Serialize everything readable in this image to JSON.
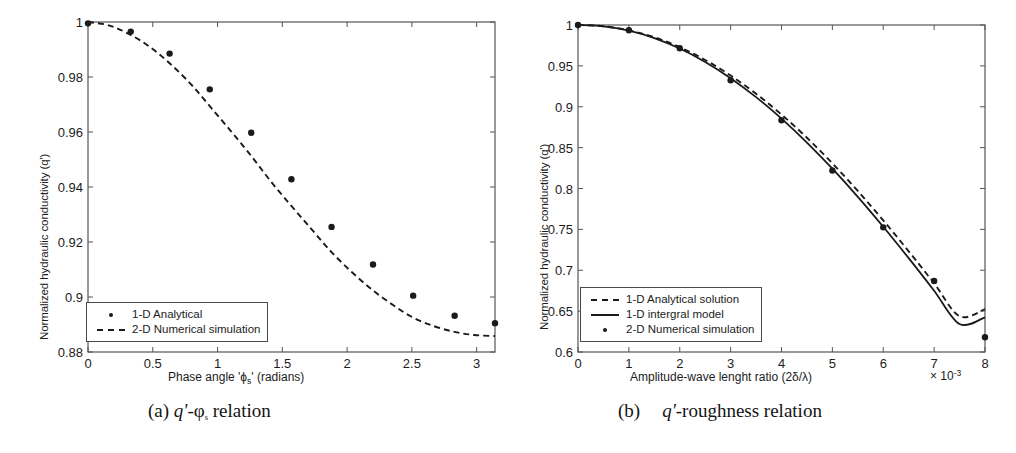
{
  "figure": {
    "background": "#ffffff",
    "ink_color": "#1a1a1a"
  },
  "panel_a": {
    "caption_prefix": "(a)",
    "caption_q": "q'",
    "caption_rest": "-φ",
    "caption_sub": "s",
    "caption_tail": " relation",
    "ylabel": "Normalized hydraulic conductivity (q')",
    "xlabel_pre": "Phase angle 'ϕ",
    "xlabel_sub": "s",
    "xlabel_post": "' (radians)",
    "legend": [
      {
        "key": "dot",
        "label": "1-D Analytical"
      },
      {
        "key": "dash",
        "label": "2-D Numerical simulation"
      }
    ]
  },
  "panel_b": {
    "caption_prefix": "(b)",
    "caption_q": "q'",
    "caption_tail": "-roughness relation",
    "ylabel": "Normalized hydraulic conductivity (q')",
    "xlabel": "Amplitude-wave lenght ratio (2δ/λ)",
    "exp_pre": "× 10",
    "exp_sup": "-3",
    "legend": [
      {
        "key": "dash",
        "label": "1-D Analytical solution"
      },
      {
        "key": "solid",
        "label": "1-D intergral model"
      },
      {
        "key": "dot",
        "label": "2-D Numerical simulation"
      }
    ]
  },
  "chart_data": [
    {
      "id": "panel-a",
      "type": "scatter",
      "title": "(a) q'-φs relation",
      "xlabel": "Phase angle 'ϕs' (radians)",
      "ylabel": "Normalized hydraulic conductivity (q')",
      "xlim": [
        0,
        3.1416
      ],
      "ylim": [
        0.88,
        1.0
      ],
      "xticks": [
        0,
        0.5,
        1,
        1.5,
        2,
        2.5,
        3
      ],
      "xticklabels": [
        "0",
        "0.5",
        "1",
        "1.5",
        "2",
        "2.5",
        "3"
      ],
      "yticks": [
        0.88,
        0.9,
        0.92,
        0.94,
        0.96,
        0.98,
        1.0
      ],
      "yticklabels": [
        "0.88",
        "0.9",
        "0.92",
        "0.94",
        "0.96",
        "0.98",
        "1"
      ],
      "grid": false,
      "legend_position": "lower-left",
      "series": [
        {
          "name": "1-D Analytical",
          "style": "markers",
          "marker": "circle",
          "x": [
            0.0,
            0.33,
            0.63,
            0.94,
            1.26,
            1.57,
            1.88,
            2.2,
            2.51,
            2.83,
            3.1416
          ],
          "y": [
            0.9995,
            0.9965,
            0.9885,
            0.9755,
            0.9597,
            0.9428,
            0.9255,
            0.9118,
            0.9005,
            0.8932,
            0.8905
          ]
        },
        {
          "name": "2-D Numerical simulation",
          "style": "dashed-line",
          "x": [
            0.0,
            0.16,
            0.31,
            0.47,
            0.63,
            0.79,
            0.94,
            1.1,
            1.26,
            1.41,
            1.57,
            1.73,
            1.88,
            2.04,
            2.2,
            2.36,
            2.51,
            2.67,
            2.83,
            2.98,
            3.1416
          ],
          "y": [
            1.0,
            0.9988,
            0.9958,
            0.9912,
            0.985,
            0.9776,
            0.9694,
            0.9605,
            0.9513,
            0.9421,
            0.9331,
            0.9244,
            0.9163,
            0.9089,
            0.9024,
            0.8969,
            0.8925,
            0.8894,
            0.8873,
            0.8862,
            0.8858
          ]
        }
      ]
    },
    {
      "id": "panel-b",
      "type": "scatter",
      "title": "(b) q'-roughness relation",
      "xlabel": "Amplitude-wave lenght ratio (2δ/λ)",
      "xlabel_multiplier": "× 10^-3",
      "ylabel": "Normalized hydraulic conductivity (q')",
      "xlim": [
        0,
        8
      ],
      "ylim": [
        0.6,
        1.0
      ],
      "xticks": [
        0,
        1,
        2,
        3,
        4,
        5,
        6,
        7,
        8
      ],
      "xticklabels": [
        "0",
        "1",
        "2",
        "3",
        "4",
        "5",
        "6",
        "7",
        "8"
      ],
      "yticks": [
        0.6,
        0.65,
        0.7,
        0.75,
        0.8,
        0.85,
        0.9,
        0.95,
        1.0
      ],
      "yticklabels": [
        "0.6",
        "0.65",
        "0.7",
        "0.75",
        "0.8",
        "0.85",
        "0.9",
        "0.95",
        "1"
      ],
      "grid": false,
      "legend_position": "lower-left",
      "series": [
        {
          "name": "1-D Analytical solution",
          "style": "dashed-line",
          "x": [
            0,
            0.5,
            1,
            1.5,
            2,
            2.5,
            3,
            3.5,
            4,
            4.5,
            5,
            5.5,
            6,
            6.5,
            7,
            7.5,
            8
          ],
          "y": [
            1.0,
            0.9985,
            0.9935,
            0.985,
            0.9728,
            0.9572,
            0.9382,
            0.9159,
            0.8905,
            0.862,
            0.8308,
            0.797,
            0.761,
            0.7232,
            0.684,
            0.6438,
            0.6525
          ]
        },
        {
          "name": "1-D intergral model",
          "style": "solid-line",
          "x": [
            0,
            0.5,
            1,
            1.5,
            2,
            2.5,
            3,
            3.5,
            4,
            4.5,
            5,
            5.5,
            6,
            6.5,
            7,
            7.5,
            8
          ],
          "y": [
            1.0,
            0.9983,
            0.993,
            0.984,
            0.9712,
            0.9548,
            0.935,
            0.9118,
            0.8855,
            0.8562,
            0.8242,
            0.7898,
            0.7532,
            0.7148,
            0.675,
            0.6342,
            0.6425
          ]
        },
        {
          "name": "2-D Numerical simulation",
          "style": "markers",
          "marker": "circle",
          "x": [
            0,
            1,
            2,
            3,
            4,
            5,
            6,
            7,
            8
          ],
          "y": [
            1.0,
            0.9935,
            0.9715,
            0.9325,
            0.8835,
            0.822,
            0.7525,
            0.687,
            0.618
          ]
        }
      ]
    }
  ]
}
